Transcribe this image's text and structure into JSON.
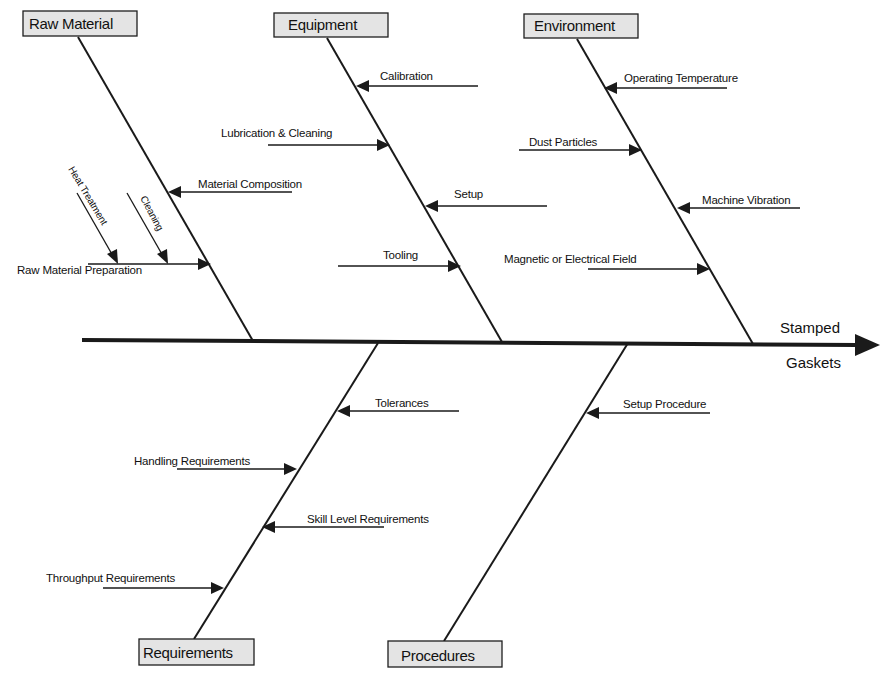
{
  "diagram": {
    "type": "fishbone",
    "effect": {
      "line1": "Stamped",
      "line2": "Gaskets"
    },
    "categories": [
      {
        "label": "Raw Material",
        "position": "top",
        "causes": [
          {
            "label": "Material Composition",
            "direction": "left"
          },
          {
            "label": "Raw Material Preparation",
            "direction": "right",
            "sub_causes": [
              {
                "label": "Heat Treatment"
              },
              {
                "label": "Cleaning"
              }
            ]
          }
        ]
      },
      {
        "label": "Equipment",
        "position": "top",
        "causes": [
          {
            "label": "Calibration",
            "direction": "left"
          },
          {
            "label": "Lubrication & Cleaning",
            "direction": "right"
          },
          {
            "label": "Setup",
            "direction": "left"
          },
          {
            "label": "Tooling",
            "direction": "right"
          }
        ]
      },
      {
        "label": "Environment",
        "position": "top",
        "causes": [
          {
            "label": "Operating Temperature",
            "direction": "left"
          },
          {
            "label": "Dust Particles",
            "direction": "right"
          },
          {
            "label": "Machine Vibration",
            "direction": "left"
          },
          {
            "label": "Magnetic or Electrical Field",
            "direction": "right"
          }
        ]
      },
      {
        "label": "Requirements",
        "position": "bottom",
        "causes": [
          {
            "label": "Tolerances",
            "direction": "left"
          },
          {
            "label": "Handling Requirements",
            "direction": "right"
          },
          {
            "label": "Skill Level Requirements",
            "direction": "left"
          },
          {
            "label": "Throughput Requirements",
            "direction": "right"
          }
        ]
      },
      {
        "label": "Procedures",
        "position": "bottom",
        "causes": [
          {
            "label": "Setup Procedure",
            "direction": "left"
          }
        ]
      }
    ]
  },
  "colors": {
    "box_fill": "#e4e4e4",
    "line": "#1a1a1a",
    "text": "#111111",
    "background": "#ffffff"
  }
}
